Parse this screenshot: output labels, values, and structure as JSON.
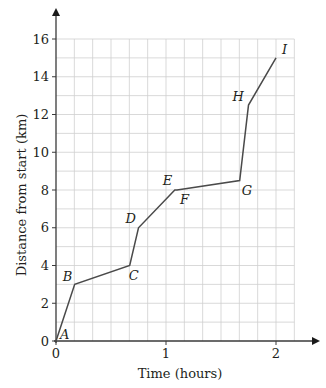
{
  "chart_data": {
    "type": "line",
    "title": "",
    "xlabel": "Time (hours)",
    "ylabel": "Distance from start (km)",
    "xlim": [
      0,
      2.1667
    ],
    "ylim": [
      0,
      16
    ],
    "x_ticks": [
      0,
      1,
      2
    ],
    "x_tick_labels": [
      "0",
      "1",
      "2"
    ],
    "y_ticks": [
      0,
      2,
      4,
      6,
      8,
      10,
      12,
      14,
      16
    ],
    "y_tick_labels": [
      "0",
      "2",
      "4",
      "6",
      "8",
      "10",
      "12",
      "14",
      "16"
    ],
    "x_grid_step": 0.16667,
    "y_grid_step": 1,
    "grid": true,
    "legend": null,
    "series": [
      {
        "name": "Journey",
        "points": [
          {
            "label": "A",
            "x": 0,
            "y": 0
          },
          {
            "label": "B",
            "x": 0.17,
            "y": 3
          },
          {
            "label": "C",
            "x": 0.67,
            "y": 4
          },
          {
            "label": "D",
            "x": 0.75,
            "y": 6
          },
          {
            "label": "E",
            "x": 1.08,
            "y": 8
          },
          {
            "label": "F",
            "x": 1.1,
            "y": 8
          },
          {
            "label": "G",
            "x": 1.67,
            "y": 8.5
          },
          {
            "label": "H",
            "x": 1.75,
            "y": 12.5
          },
          {
            "label": "I",
            "x": 2.0,
            "y": 15
          }
        ]
      }
    ],
    "point_label_offsets": {
      "A": [
        4,
        -2
      ],
      "B": [
        -12,
        -3
      ],
      "C": [
        -1,
        14
      ],
      "D": [
        -13,
        -5
      ],
      "E": [
        -12,
        -5
      ],
      "F": [
        3,
        14
      ],
      "G": [
        2,
        14
      ],
      "H": [
        -16,
        -4
      ],
      "I": [
        6,
        -4
      ]
    }
  },
  "colors": {
    "grid": "#cfcfcf",
    "axis": "#3a3a3a",
    "line": "#4a4a4a",
    "text": "#231f20"
  }
}
